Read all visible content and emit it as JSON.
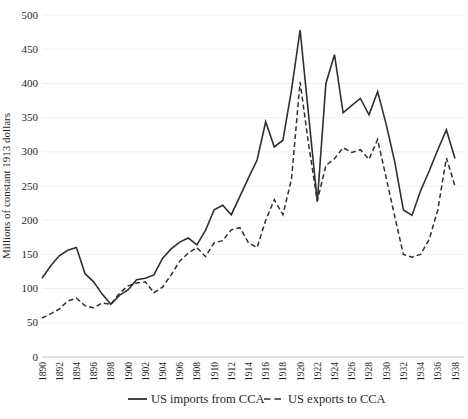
{
  "figure": {
    "background": "#ffffff",
    "line_color": "#2f2f2f",
    "grid_color": "#efefef",
    "axis_color": "#c4c4c4",
    "text_color": "#1f1f1f"
  },
  "chart_data": {
    "type": "line",
    "title": "",
    "xlabel": "",
    "ylabel": "Millions of constant 1913 dollars",
    "ylim": [
      0,
      500
    ],
    "ytick_step": 50,
    "xtick_label_interval": 2,
    "grid": "faint horizontal gridlines every 50",
    "legend_position": "bottom-center",
    "x": [
      1890,
      1891,
      1892,
      1893,
      1894,
      1895,
      1896,
      1897,
      1898,
      1899,
      1900,
      1901,
      1902,
      1903,
      1904,
      1905,
      1906,
      1907,
      1908,
      1909,
      1910,
      1911,
      1912,
      1913,
      1914,
      1915,
      1916,
      1917,
      1918,
      1919,
      1920,
      1921,
      1922,
      1923,
      1924,
      1925,
      1926,
      1927,
      1928,
      1929,
      1930,
      1931,
      1932,
      1933,
      1934,
      1935,
      1936,
      1937,
      1938
    ],
    "series": [
      {
        "name": "US imports from CCA",
        "style": "solid",
        "values": [
          115,
          133,
          148,
          156,
          160,
          122,
          110,
          92,
          77,
          90,
          98,
          113,
          115,
          120,
          144,
          158,
          168,
          174,
          164,
          185,
          215,
          222,
          208,
          235,
          262,
          288,
          344,
          307,
          317,
          390,
          478,
          352,
          227,
          400,
          442,
          357,
          368,
          378,
          354,
          388,
          340,
          285,
          215,
          207,
          243,
          272,
          303,
          332,
          290
        ]
      },
      {
        "name": "US exports to CCA",
        "style": "dashed",
        "values": [
          57,
          63,
          70,
          82,
          86,
          75,
          72,
          79,
          77,
          93,
          104,
          108,
          110,
          94,
          102,
          120,
          140,
          152,
          160,
          147,
          167,
          170,
          186,
          189,
          167,
          160,
          200,
          230,
          208,
          260,
          402,
          310,
          228,
          280,
          290,
          306,
          299,
          303,
          289,
          318,
          262,
          205,
          150,
          146,
          150,
          172,
          215,
          291,
          250
        ]
      }
    ]
  }
}
